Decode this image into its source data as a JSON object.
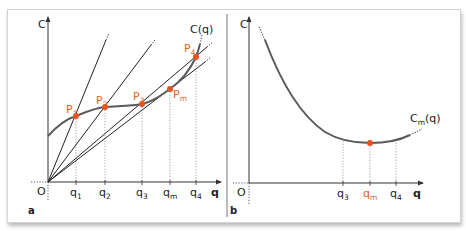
{
  "colors": {
    "axis": "#333333",
    "curve": "#5a5a5a",
    "ray": "#222222",
    "point": "#e8501e",
    "accent_label": "#e8621e",
    "guide": "#8a8a8a",
    "frame_border": "#d4d4d4"
  },
  "panel_a": {
    "label": "a",
    "y_axis_label": "C",
    "x_axis_label": "q",
    "origin_label": "O",
    "curve_label": "C(q)",
    "points": [
      {
        "name": "P",
        "sub": "1",
        "tick": "q",
        "tick_sub": "1"
      },
      {
        "name": "P",
        "sub": "2",
        "tick": "q",
        "tick_sub": "2"
      },
      {
        "name": "P",
        "sub": "3",
        "tick": "q",
        "tick_sub": "3"
      },
      {
        "name": "P",
        "sub": "m",
        "tick": "q",
        "tick_sub": "m"
      },
      {
        "name": "P",
        "sub": "4",
        "tick": "q",
        "tick_sub": "4"
      }
    ]
  },
  "panel_b": {
    "label": "b",
    "y_axis_label": "C",
    "x_axis_label": "q",
    "origin_label": "O",
    "curve_label": "C",
    "curve_label_sub": "m",
    "curve_label_suffix": "(q)",
    "ticks": [
      {
        "tick": "q",
        "tick_sub": "3",
        "highlight": false
      },
      {
        "tick": "q",
        "tick_sub": "m",
        "highlight": true
      },
      {
        "tick": "q",
        "tick_sub": "4",
        "highlight": false
      }
    ]
  }
}
